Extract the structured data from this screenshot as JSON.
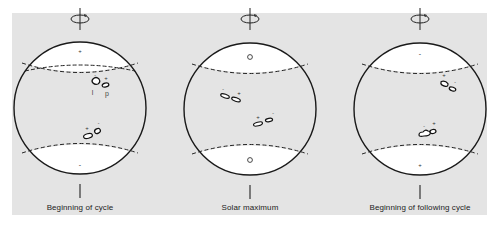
{
  "figure": {
    "background_color": "#e4e4e4",
    "cap_color": "#ffffff",
    "line_color": "#1a1a1a",
    "panels": [
      {
        "id": "beginning-of-cycle",
        "caption": "Beginning of cycle",
        "center_x": 80,
        "north_pole_mark": "+",
        "south_pole_mark": "-",
        "spot_labels": {
          "leading": "l",
          "preceding": "p"
        },
        "north_group": {
          "left_sign": "-",
          "right_sign": "+"
        },
        "south_group": {
          "left_sign": "+",
          "right_sign": "-"
        }
      },
      {
        "id": "solar-maximum",
        "caption": "Solar maximum",
        "center_x": 250,
        "north_pole_mark": "o",
        "south_pole_mark": "o",
        "north_group": {
          "left_sign": "-",
          "right_sign": "+"
        },
        "south_group": {
          "left_sign": "+",
          "right_sign": "-"
        }
      },
      {
        "id": "beginning-of-following-cycle",
        "caption": "Beginning of following cycle",
        "center_x": 420,
        "north_pole_mark": "-",
        "south_pole_mark": "+",
        "north_group": {
          "left_sign": "+",
          "right_sign": "-"
        },
        "south_group": {
          "left_sign": "-",
          "right_sign": "+"
        }
      }
    ]
  }
}
